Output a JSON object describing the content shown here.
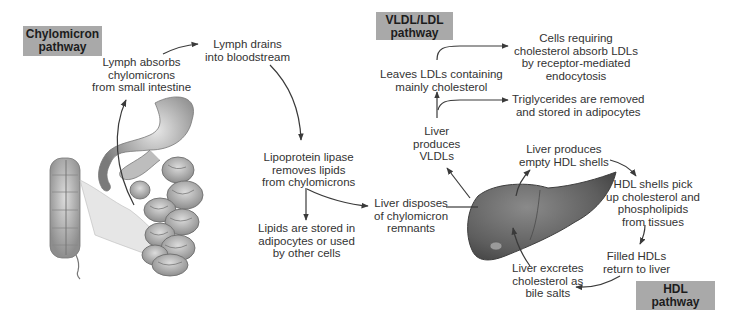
{
  "diagram": {
    "type": "lipoprotein-transport-pathways",
    "badges": {
      "chylomicron": [
        "Chylomicron",
        "pathway"
      ],
      "vldl_ldl": [
        "VLDL/LDL",
        "pathway"
      ],
      "hdl": [
        "HDL",
        "pathway"
      ]
    },
    "chylomicron_pathway": {
      "lymph_absorbs": [
        "Lymph absorbs",
        "chylomicrons",
        "from small intestine"
      ],
      "lymph_drains": [
        "Lymph drains",
        "into bloodstream"
      ],
      "lipoprotein_lipase": [
        "Lipoprotein lipase",
        "removes lipids",
        "from chylomicrons"
      ],
      "lipids_stored": [
        "Lipids are stored in",
        "adipocytes or used",
        "by other cells"
      ],
      "liver_disposes": [
        "Liver disposes",
        "of chylomicron",
        "remnants"
      ]
    },
    "vldl_ldl_pathway": {
      "liver_produces_vldl": [
        "Liver",
        "produces",
        "VLDLs"
      ],
      "triglycerides_removed": [
        "Triglycerides are removed",
        "and stored in adipocytes"
      ],
      "leaves_ldl": [
        "Leaves LDLs containing",
        "mainly cholesterol"
      ],
      "cells_absorb_ldl": [
        "Cells requiring",
        "cholesterol absorb LDLs",
        "by receptor-mediated",
        "endocytosis"
      ]
    },
    "hdl_pathway": {
      "liver_produces_hdl": [
        "Liver produces",
        "empty HDL shells"
      ],
      "hdl_pick_up": [
        "HDL shells pick",
        "up cholesterol and",
        "phospholipids",
        "from tissues"
      ],
      "filled_hdl": [
        "Filled HDLs",
        "return to liver"
      ],
      "liver_excretes": [
        "Liver excretes",
        "cholesterol as",
        "bile salts"
      ]
    },
    "illustrations": [
      "digestive-tract (stomach, small intestine, colon)",
      "liver"
    ],
    "colors": {
      "badge_bg": "#a9a9a9",
      "text": "#333333",
      "arrow": "#3a3a3a",
      "liver": "#6e6e6e",
      "intestine": "#b5b5b5"
    }
  }
}
